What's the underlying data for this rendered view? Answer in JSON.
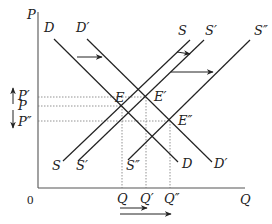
{
  "diagram": {
    "type": "supply-demand",
    "axes": {
      "y_label": "P",
      "x_label": "Q",
      "origin_label": "0"
    },
    "curves": {
      "demand": [
        {
          "label": "D",
          "from": [
            54,
            39
          ],
          "to": [
            178,
            162
          ]
        },
        {
          "label": "D′",
          "from": [
            87,
            39
          ],
          "to": [
            212,
            162
          ]
        }
      ],
      "supply": [
        {
          "label": "S",
          "from": [
            63,
            161
          ],
          "to": [
            190,
            40
          ]
        },
        {
          "label": "S′",
          "from": [
            78,
            161
          ],
          "to": [
            204,
            40
          ]
        },
        {
          "label": "S″",
          "from": [
            128,
            160
          ],
          "to": [
            250,
            40
          ]
        }
      ]
    },
    "equilibria": [
      {
        "label": "E",
        "price": "P",
        "quantity": "Q"
      },
      {
        "label": "E′",
        "price": "P′",
        "quantity": "Q′"
      },
      {
        "label": "E″",
        "price": "P″",
        "quantity": "Q″"
      }
    ],
    "price_labels": [
      "P′",
      "P",
      "P″"
    ],
    "quantity_labels": [
      "Q",
      "Q′",
      "Q″"
    ],
    "shifts": [
      {
        "name": "demand-shift-right",
        "from": "D",
        "to": "D′"
      },
      {
        "name": "supply-shift-small",
        "from": "S",
        "to": "S′"
      },
      {
        "name": "supply-shift-large",
        "from": "S",
        "to": "S″"
      }
    ]
  }
}
